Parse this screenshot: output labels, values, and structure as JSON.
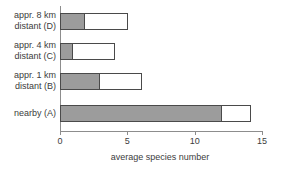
{
  "chart_data": {
    "type": "bar",
    "orientation": "horizontal",
    "stacked": true,
    "title": "",
    "xlabel": "average species number",
    "ylabel": "",
    "xlim": [
      0,
      15
    ],
    "xticks": [
      0,
      5,
      10,
      15
    ],
    "xtick_labels": [
      "0",
      "5",
      "10",
      "15"
    ],
    "grid": false,
    "legend": "none",
    "categories": [
      "appr. 8 km distant (D)",
      "appr. 4 km distant (C)",
      "appr. 1 km distant (B)",
      "nearby (A)"
    ],
    "series": [
      {
        "name": "shaded segment",
        "color": "#9c9c9c",
        "values": [
          1.85,
          1.0,
          3.0,
          12.0
        ]
      },
      {
        "name": "open segment",
        "color": "#ffffff",
        "values": [
          3.2,
          3.1,
          3.1,
          2.2
        ]
      }
    ],
    "totals": [
      5.05,
      4.1,
      6.1,
      14.2
    ]
  },
  "axis": {
    "x_title": "average species number",
    "ticks": [
      {
        "label": "0",
        "value": 0
      },
      {
        "label": "5",
        "value": 5
      },
      {
        "label": "10",
        "value": 10
      },
      {
        "label": "15",
        "value": 15
      }
    ]
  },
  "categories": [
    {
      "line1": "appr. 8 km",
      "line2": "distant (D)",
      "full": "appr. 8 km distant (D)"
    },
    {
      "line1": "appr. 4 km",
      "line2": "distant (C)",
      "full": "appr. 4 km distant (C)"
    },
    {
      "line1": "appr. 1 km",
      "line2": "distant (B)",
      "full": "appr. 1 km distant (B)"
    },
    {
      "line1": "nearby (A)",
      "line2": "",
      "full": "nearby (A)"
    }
  ],
  "colors": {
    "fill_shaded": "#9c9c9c",
    "fill_open": "#ffffff",
    "bar_outline": "#4a4a4a",
    "axis": "#8d8d8d",
    "text": "#3c3c3c",
    "background": "#ffffff"
  }
}
